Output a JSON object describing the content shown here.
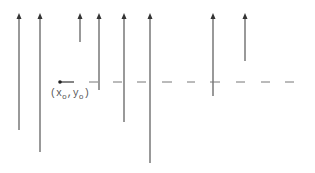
{
  "diagram": {
    "colors": {
      "line": "#555555",
      "dash": "#888888",
      "background": "#ffffff"
    },
    "origin": {
      "x": 60,
      "y": 82,
      "label_main": "(x",
      "label_sub1": "o",
      "label_mid": ",y",
      "label_sub2": "o",
      "label_end": ")"
    },
    "baseline": {
      "y": 82,
      "x_start": 60,
      "x_end": 300,
      "style": "dashed"
    },
    "arrows": [
      {
        "x": 19,
        "top": 15,
        "bottom": 130
      },
      {
        "x": 40,
        "top": 15,
        "bottom": 152
      },
      {
        "x": 80,
        "top": 15,
        "bottom": 42
      },
      {
        "x": 99,
        "top": 15,
        "bottom": 90
      },
      {
        "x": 124,
        "top": 15,
        "bottom": 122
      },
      {
        "x": 150,
        "top": 15,
        "bottom": 163
      },
      {
        "x": 213,
        "top": 15,
        "bottom": 96
      },
      {
        "x": 245,
        "top": 15,
        "bottom": 61
      }
    ]
  }
}
